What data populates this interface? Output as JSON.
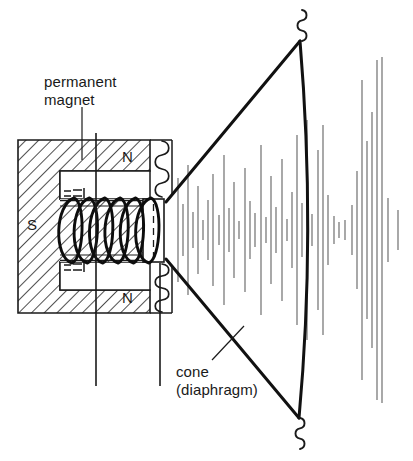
{
  "figure": {
    "background_color": "#ffffff",
    "ink_color": "#1a1a1a",
    "wave_color": "#5a5a5a",
    "width": 413,
    "height": 461
  },
  "labels": {
    "permanent_magnet": "permanent\nmagnet",
    "permanent_magnet_line1": "permanent",
    "permanent_magnet_line2": "magnet",
    "cone": "cone\n(diaphragm)",
    "cone_line1": "cone",
    "cone_line2": "(diaphragm)"
  },
  "poles": {
    "north_top": "N",
    "south": "S",
    "north_bottom": "N"
  },
  "chart_data": {
    "type": "diagram",
    "components": [
      {
        "name": "permanent-magnet",
        "label": "permanent magnet",
        "shape": "C-shaped hatched block"
      },
      {
        "name": "pole-piece-top",
        "label": "N",
        "shape": "rectangle"
      },
      {
        "name": "pole-piece-bottom",
        "label": "N",
        "shape": "rectangle"
      },
      {
        "name": "magnet-body",
        "label": "S",
        "shape": "hatched"
      },
      {
        "name": "voice-coil",
        "label": "",
        "turns": 6
      },
      {
        "name": "cone",
        "label": "cone (diaphragm)",
        "shape": "funnel"
      },
      {
        "name": "suspension-spring-top",
        "label": "",
        "shape": "squiggle"
      },
      {
        "name": "suspension-spring-bottom",
        "label": "",
        "shape": "squiggle"
      },
      {
        "name": "sound-waves",
        "label": "",
        "shape": "vertical line field"
      }
    ],
    "sound_waves": {
      "center_y": 230,
      "lines": [
        {
          "x": 178,
          "len": 104
        },
        {
          "x": 183,
          "len": 52
        },
        {
          "x": 188,
          "len": 130
        },
        {
          "x": 193,
          "len": 36
        },
        {
          "x": 198,
          "len": 88
        },
        {
          "x": 203,
          "len": 20
        },
        {
          "x": 208,
          "len": 60
        },
        {
          "x": 213,
          "len": 112
        },
        {
          "x": 219,
          "len": 30
        },
        {
          "x": 224,
          "len": 150
        },
        {
          "x": 229,
          "len": 44
        },
        {
          "x": 234,
          "len": 96
        },
        {
          "x": 239,
          "len": 18
        },
        {
          "x": 245,
          "len": 124
        },
        {
          "x": 250,
          "len": 58
        },
        {
          "x": 255,
          "len": 34
        },
        {
          "x": 261,
          "len": 170
        },
        {
          "x": 266,
          "len": 26
        },
        {
          "x": 271,
          "len": 108
        },
        {
          "x": 276,
          "len": 46
        },
        {
          "x": 282,
          "len": 142
        },
        {
          "x": 287,
          "len": 22
        },
        {
          "x": 292,
          "len": 76
        },
        {
          "x": 297,
          "len": 190
        },
        {
          "x": 302,
          "len": 54
        },
        {
          "x": 307,
          "len": 220
        },
        {
          "x": 312,
          "len": 32
        },
        {
          "x": 318,
          "len": 160
        },
        {
          "x": 323,
          "len": 210
        },
        {
          "x": 328,
          "len": 70
        },
        {
          "x": 334,
          "len": 28
        },
        {
          "x": 339,
          "len": 16
        },
        {
          "x": 345,
          "len": 20
        },
        {
          "x": 352,
          "len": 50
        },
        {
          "x": 357,
          "len": 118
        },
        {
          "x": 362,
          "len": 300
        },
        {
          "x": 367,
          "len": 178
        },
        {
          "x": 372,
          "len": 236
        },
        {
          "x": 377,
          "len": 340
        },
        {
          "x": 382,
          "len": 346
        },
        {
          "x": 388,
          "len": 64
        },
        {
          "x": 398,
          "len": 40
        }
      ]
    }
  }
}
